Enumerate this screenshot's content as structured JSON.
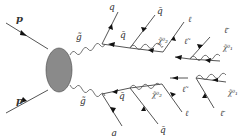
{
  "diagram": {
    "incoming": [
      {
        "label": "p",
        "position": "top-left"
      },
      {
        "label": "p",
        "position": "bottom-left"
      }
    ],
    "blob": {
      "color": "#8a8a8a"
    },
    "labels": {
      "gluino_top": "g̃",
      "gluino_bottom": "g̃",
      "q_top": "q",
      "qbar_top": "q̄",
      "qbar_top2": "q̄",
      "chi2_top": "χ̃⁰₂",
      "l_top": "ℓ",
      "lbar_top": "ℓ̃",
      "lbar_top2": "ℓ̄",
      "chi1_top": "χ̃⁰₁",
      "q_bottom": "q",
      "qbar_bottom": "q̄",
      "qbar_bottom2": "q̄",
      "chi2_bottom": "χ̃⁰₂",
      "l_bottom": "ℓ",
      "lbar_bottom": "ℓ̃",
      "lbar_bottom2": "ℓ̄",
      "chi1_bottom": "χ̃⁰₁"
    }
  }
}
